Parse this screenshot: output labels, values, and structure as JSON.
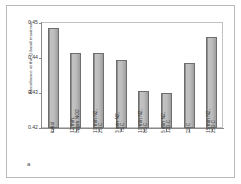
{
  "figure": {
    "panel_letter": "a"
  },
  "chart_data": {
    "type": "bar",
    "title": "",
    "xlabel": "",
    "ylabel": "Absorbance at the Q-band maximum",
    "ylim": [
      0.42,
      0.45
    ],
    "yticks": [
      "0.42",
      "0.43",
      "0.44",
      "0.45"
    ],
    "ytick_values": [
      0.42,
      0.43,
      0.44,
      0.45
    ],
    "grid": false,
    "legend": "none",
    "categories": [
      "initial",
      "12 min, 5ppm NO2",
      "10 min N2, 20 C",
      "3 min N2, 75 C",
      "10 min N2, 80 C",
      "5 min N2, 120 C",
      "20 C",
      "15 min N2, 200 C"
    ],
    "category_lines": [
      [
        "initial"
      ],
      [
        "12 min,",
        "5ppm NO2"
      ],
      [
        "10 min N2,",
        "20 C"
      ],
      [
        "3 min N2,",
        "75 C"
      ],
      [
        "10 min N2,",
        "80 C"
      ],
      [
        "5 min N2,",
        "120 C"
      ],
      [
        "20 C"
      ],
      [
        "15 min N2,",
        "200 C"
      ]
    ],
    "values": [
      0.4485,
      0.4415,
      0.4415,
      0.4393,
      0.4307,
      0.43,
      0.4385,
      0.446
    ],
    "bar_color": "#bdbdbd",
    "bar_edge_color": "#6e6e6e"
  }
}
